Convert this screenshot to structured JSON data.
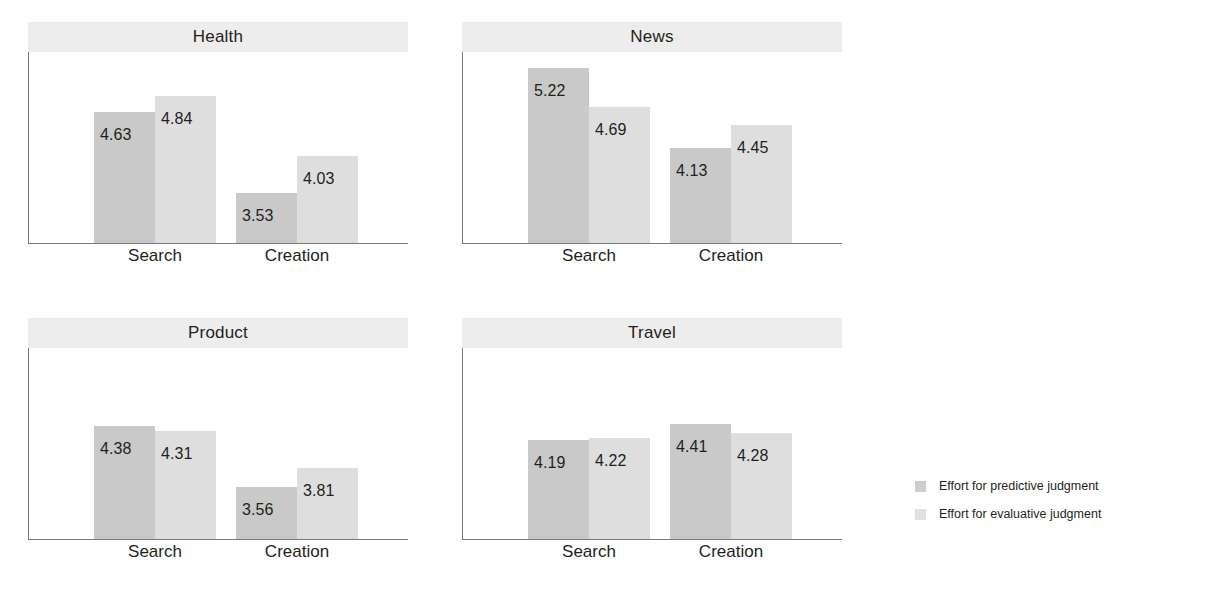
{
  "chart_data": {
    "type": "bar",
    "title": "",
    "subtitle": "",
    "xlabel": "",
    "ylabel": "",
    "grid": false,
    "legend_position": "right",
    "categories": [
      "Search",
      "Creation"
    ],
    "series": [
      {
        "name": "Effort for predictive judgment",
        "color": "#c9c9c9"
      },
      {
        "name": "Effort for evaluative judgment",
        "color": "#dedede"
      }
    ],
    "ylim": [
      2.85,
      5.45
    ],
    "facets": [
      {
        "title": "Health",
        "groups": [
          {
            "category": "Search",
            "values": [
              4.63,
              4.84
            ],
            "labels": [
              "4.63",
              "4.84"
            ]
          },
          {
            "category": "Creation",
            "values": [
              3.53,
              4.03
            ],
            "labels": [
              "3.53",
              "4.03"
            ]
          }
        ]
      },
      {
        "title": "News",
        "groups": [
          {
            "category": "Search",
            "values": [
              5.22,
              4.69
            ],
            "labels": [
              "5.22",
              "4.69"
            ]
          },
          {
            "category": "Creation",
            "values": [
              4.13,
              4.45
            ],
            "labels": [
              "4.13",
              "4.45"
            ]
          }
        ]
      },
      {
        "title": "Product",
        "groups": [
          {
            "category": "Search",
            "values": [
              4.38,
              4.31
            ],
            "labels": [
              "4.38",
              "4.31"
            ]
          },
          {
            "category": "Creation",
            "values": [
              3.56,
              3.81
            ],
            "labels": [
              "3.56",
              "3.81"
            ]
          }
        ]
      },
      {
        "title": "Travel",
        "groups": [
          {
            "category": "Search",
            "values": [
              4.19,
              4.22
            ],
            "labels": [
              "4.19",
              "4.22"
            ]
          },
          {
            "category": "Creation",
            "values": [
              4.41,
              4.28
            ],
            "labels": [
              "4.41",
              "4.28"
            ]
          }
        ]
      }
    ]
  },
  "legend": {
    "items": [
      {
        "label": "Effort for predictive judgment",
        "color": "#cdcdcd"
      },
      {
        "label": "Effort for evaluative judgment",
        "color": "#e0e0e0"
      }
    ]
  }
}
